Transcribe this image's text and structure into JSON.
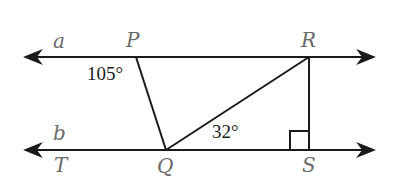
{
  "diagram": {
    "lines": [
      {
        "name": "a",
        "label": "a"
      },
      {
        "name": "b",
        "label": "b"
      }
    ],
    "points": {
      "P": "P",
      "R": "R",
      "T": "T",
      "Q": "Q",
      "S": "S"
    },
    "angles": {
      "angle_P": "105°",
      "angle_Q": "32°"
    },
    "right_angle_at": "S",
    "colors": {
      "line": "#1a1a1a",
      "label": "#6a6a6a"
    }
  }
}
